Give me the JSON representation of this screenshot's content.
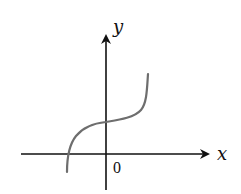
{
  "diagram": {
    "type": "function-graph",
    "axes": {
      "x_label": "x",
      "y_label": "y",
      "origin_label": "0"
    },
    "colors": {
      "axis": "#111111",
      "curve": "#6e6e6e",
      "background": "#ffffff"
    },
    "curve_description": "increasing cubic-like curve crossing the negative x-axis and the positive y-axis, with an inflection near the y-axis"
  }
}
